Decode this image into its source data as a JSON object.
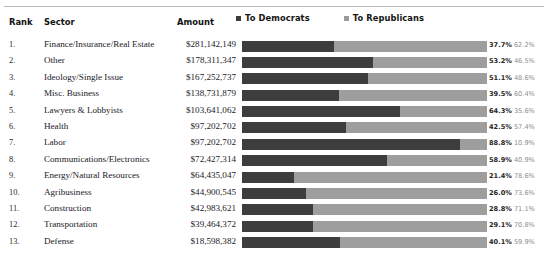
{
  "table": {
    "headers": {
      "rank": "Rank",
      "sector": "Sector",
      "amount": "Amount"
    }
  },
  "legend": {
    "democrats_label": "To Democrats",
    "republicans_label": "To Republicans",
    "democrats_color": "#3d3d3d",
    "republicans_color": "#9e9e9e"
  },
  "chart_data": {
    "type": "bar",
    "title": "",
    "xlabel": "",
    "ylabel": "",
    "orientation": "horizontal",
    "stacked": true,
    "grid": false,
    "legend_position": "top",
    "xlim": [
      0,
      100
    ],
    "categories": [
      "Finance/Insurance/Real Estate",
      "Other",
      "Ideology/Single Issue",
      "Misc. Business",
      "Lawyers & Lobbyists",
      "Health",
      "Labor",
      "Communications/Electronics",
      "Energy/Natural Resources",
      "Agribusiness",
      "Construction",
      "Transportation",
      "Defense"
    ],
    "series": [
      {
        "name": "To Democrats",
        "values": [
          37.7,
          53.2,
          51.1,
          39.5,
          64.3,
          42.5,
          88.8,
          58.9,
          21.4,
          26.0,
          28.8,
          29.1,
          40.1
        ]
      },
      {
        "name": "To Republicans",
        "values": [
          62.2,
          46.5,
          48.6,
          60.4,
          35.6,
          57.4,
          10.9,
          40.9,
          78.6,
          73.6,
          71.1,
          70.8,
          59.9
        ]
      }
    ],
    "amounts": [
      281142149,
      178311347,
      167252737,
      138731879,
      103641062,
      97202702,
      97202702,
      72427314,
      64435047,
      44900545,
      42983621,
      39464372,
      18598382
    ]
  },
  "rows": [
    {
      "rank": "1.",
      "sector": "Finance/Insurance/Real Estate",
      "amount": "$281,142,149",
      "dem_pct": 37.7,
      "rep_pct": 62.2,
      "dem_label": "37.7%",
      "rep_label": "62.2%"
    },
    {
      "rank": "2.",
      "sector": "Other",
      "amount": "$178,311,347",
      "dem_pct": 53.2,
      "rep_pct": 46.5,
      "dem_label": "53.2%",
      "rep_label": "46.5%"
    },
    {
      "rank": "3.",
      "sector": "Ideology/Single Issue",
      "amount": "$167,252,737",
      "dem_pct": 51.1,
      "rep_pct": 48.6,
      "dem_label": "51.1%",
      "rep_label": "48.6%"
    },
    {
      "rank": "4.",
      "sector": "Misc. Business",
      "amount": "$138,731,879",
      "dem_pct": 39.5,
      "rep_pct": 60.4,
      "dem_label": "39.5%",
      "rep_label": "60.4%"
    },
    {
      "rank": "5.",
      "sector": "Lawyers & Lobbyists",
      "amount": "$103,641,062",
      "dem_pct": 64.3,
      "rep_pct": 35.6,
      "dem_label": "64.3%",
      "rep_label": "35.6%"
    },
    {
      "rank": "6.",
      "sector": "Health",
      "amount": "$97,202,702",
      "dem_pct": 42.5,
      "rep_pct": 57.4,
      "dem_label": "42.5%",
      "rep_label": "57.4%"
    },
    {
      "rank": "7.",
      "sector": "Labor",
      "amount": "$97,202,702",
      "dem_pct": 88.8,
      "rep_pct": 10.9,
      "dem_label": "88.8%",
      "rep_label": "10.9%"
    },
    {
      "rank": "8.",
      "sector": "Communications/Electronics",
      "amount": "$72,427,314",
      "dem_pct": 58.9,
      "rep_pct": 40.9,
      "dem_label": "58.9%",
      "rep_label": "40.9%"
    },
    {
      "rank": "9.",
      "sector": "Energy/Natural Resources",
      "amount": "$64,435,047",
      "dem_pct": 21.4,
      "rep_pct": 78.6,
      "dem_label": "21.4%",
      "rep_label": "78.6%"
    },
    {
      "rank": "10.",
      "sector": "Agribusiness",
      "amount": "$44,900,545",
      "dem_pct": 26.0,
      "rep_pct": 73.6,
      "dem_label": "26.0%",
      "rep_label": "73.6%"
    },
    {
      "rank": "11.",
      "sector": "Construction",
      "amount": "$42,983,621",
      "dem_pct": 28.8,
      "rep_pct": 71.1,
      "dem_label": "28.8%",
      "rep_label": "71.1%"
    },
    {
      "rank": "12.",
      "sector": "Transportation",
      "amount": "$39,464,372",
      "dem_pct": 29.1,
      "rep_pct": 70.8,
      "dem_label": "29.1%",
      "rep_label": "70.8%"
    },
    {
      "rank": "13.",
      "sector": "Defense",
      "amount": "$18,598,382",
      "dem_pct": 40.1,
      "rep_pct": 59.9,
      "dem_label": "40.1%",
      "rep_label": "59.9%"
    }
  ]
}
